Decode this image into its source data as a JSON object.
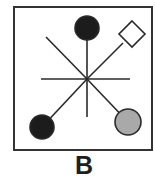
{
  "figure": {
    "label": "B",
    "colors": {
      "stroke": "#2a2a2a",
      "frame": "#333333",
      "black_node": "#1c1c1c",
      "gray_node": "#a9a9a9",
      "white_node": "#ffffff",
      "background": "#ffffff"
    },
    "frame": {
      "x": 14,
      "y": 7,
      "width": 138,
      "height": 143
    },
    "center": {
      "x": 87,
      "y": 79
    },
    "spokes": [
      {
        "name": "horizontal",
        "x1": 41,
        "y1": 79,
        "x2": 130,
        "y2": 79
      },
      {
        "name": "vertical",
        "x1": 87,
        "y1": 28,
        "x2": 87,
        "y2": 117
      },
      {
        "name": "diag-top-left",
        "x1": 46,
        "y1": 37,
        "x2": 87,
        "y2": 79
      },
      {
        "name": "diag-to-diamond",
        "x1": 87,
        "y1": 79,
        "x2": 123,
        "y2": 43
      },
      {
        "name": "diag-to-bottom-left",
        "x1": 87,
        "y1": 79,
        "x2": 42,
        "y2": 127
      },
      {
        "name": "diag-to-bottom-right",
        "x1": 87,
        "y1": 79,
        "x2": 128,
        "y2": 122
      }
    ],
    "nodes": [
      {
        "name": "top-black-circle",
        "shape": "circle",
        "fill": "black",
        "cx": 87,
        "cy": 28,
        "r": 12
      },
      {
        "name": "top-right-white-diamond",
        "shape": "diamond",
        "fill": "white",
        "cx": 132,
        "cy": 34,
        "half": 13
      },
      {
        "name": "bottom-left-black-circle",
        "shape": "circle",
        "fill": "black",
        "cx": 42,
        "cy": 127,
        "r": 12
      },
      {
        "name": "bottom-right-gray-circle",
        "shape": "circle",
        "fill": "gray",
        "cx": 128,
        "cy": 122,
        "r": 13
      }
    ]
  }
}
